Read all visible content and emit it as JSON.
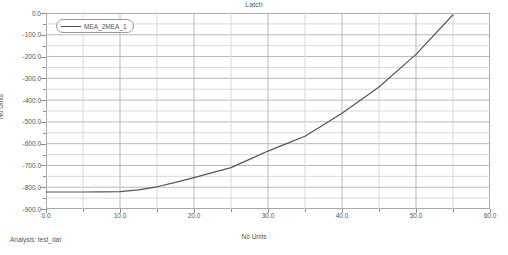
{
  "header": {
    "title": "Latch"
  },
  "footer": {
    "analysis_label": "Analysis:  test_dat"
  },
  "legend": {
    "entries": [
      {
        "label": "MEA_2MEA_1",
        "color": "#555555"
      }
    ]
  },
  "axes": {
    "x": {
      "label": "No Units",
      "ticks": [
        "0.0",
        "10.0",
        "20.0",
        "30.0",
        "40.0",
        "50.0",
        "60.0"
      ],
      "tick_values": [
        0,
        10,
        20,
        30,
        40,
        50,
        60
      ],
      "minor_step": 5,
      "range": [
        0,
        60
      ]
    },
    "y": {
      "label": "No Units",
      "ticks": [
        "0.0",
        "-100.0",
        "-200.0",
        "-300.0",
        "-400.0",
        "-500.0",
        "-600.0",
        "-700.0",
        "-800.0",
        "-900.0"
      ],
      "tick_values": [
        0,
        -100,
        -200,
        -300,
        -400,
        -500,
        -600,
        -700,
        -800,
        -900
      ],
      "minor_step": 50,
      "range": [
        -900,
        0
      ]
    }
  },
  "chart_data": {
    "type": "line",
    "title": "Latch",
    "xlabel": "No Units",
    "ylabel": "No Units",
    "xlim": [
      0,
      60
    ],
    "ylim": [
      -900,
      0
    ],
    "grid": true,
    "grid_x_step": 5,
    "grid_y_step": 50,
    "legend_position": "top-left",
    "annotation": "Analysis:  test_dat",
    "series": [
      {
        "name": "MEA_2MEA_1",
        "color": "#555555",
        "x": [
          0,
          2.5,
          5,
          7.5,
          10,
          12.5,
          15,
          17.5,
          20,
          22.5,
          25,
          27.5,
          30,
          32.5,
          35,
          40,
          45,
          50,
          55
        ],
        "y": [
          -822,
          -822,
          -822,
          -821,
          -820,
          -812,
          -798,
          -778,
          -756,
          -733,
          -710,
          -672,
          -634,
          -600,
          -566,
          -460,
          -340,
          -190,
          -8
        ]
      }
    ]
  }
}
